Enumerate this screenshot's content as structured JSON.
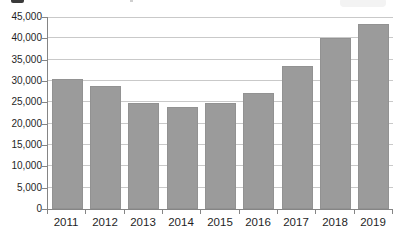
{
  "chart_data": {
    "type": "bar",
    "title": "",
    "categories": [
      "2011",
      "2012",
      "2013",
      "2014",
      "2015",
      "2016",
      "2017",
      "2018",
      "2019"
    ],
    "values": [
      30500,
      28800,
      24800,
      24000,
      24900,
      27300,
      33400,
      40000,
      43300
    ],
    "xlabel": "",
    "ylabel": "",
    "ylim": [
      0,
      45000
    ],
    "y_tick_step": 5000,
    "y_tick_labels": [
      "0",
      "5,000",
      "10,000",
      "15,000",
      "20,000",
      "25,000",
      "30,000",
      "35,000",
      "40,000",
      "45,000"
    ],
    "grid": true,
    "legend": false,
    "colors": {
      "bar_fill": "#9b9b9b",
      "bar_border": "#929292",
      "gridline": "#c9c9c9",
      "axis": "#858585",
      "label_text": "#1f1f1f",
      "background": "#ffffff"
    }
  }
}
